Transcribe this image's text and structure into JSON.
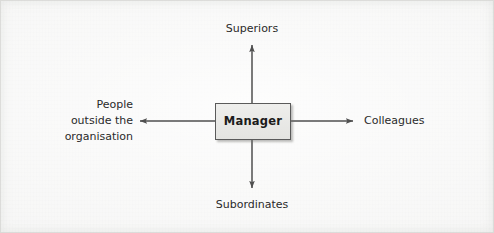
{
  "diagram": {
    "title_text": "",
    "center_node": {
      "label": "Manager",
      "box_fill": "#e8e8e5",
      "box_border": "#5a5a5a"
    },
    "labels": {
      "top": "Superiors",
      "bottom": "Subordinates",
      "left": "People\noutside the\norganisation",
      "right": "Colleagues"
    },
    "arrow_color": "#4f4f4f",
    "background_color": "#f2f2f1",
    "text_color": "#2a2a2a"
  }
}
